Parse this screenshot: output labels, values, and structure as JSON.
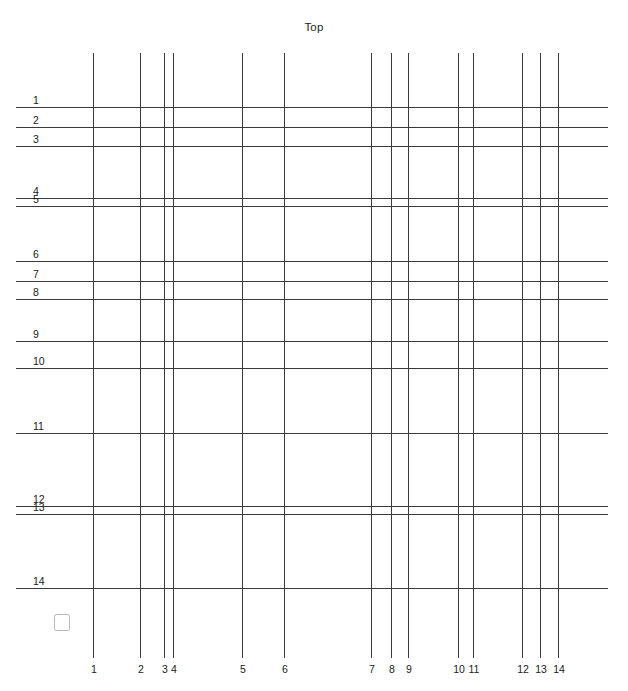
{
  "diagram": {
    "title": "Top",
    "background_color": "#ffffff",
    "line_color": "#3a3a3a",
    "label_color": "#1a1a1a",
    "marker_color": "#b7b7b7",
    "canvas": {
      "width": 628,
      "height": 691
    }
  },
  "vertical_lines": {
    "axis_label_position": "bottom",
    "span": {
      "y_start": 53,
      "y_end": 658
    },
    "items": [
      {
        "label": "1",
        "x": 93
      },
      {
        "label": "2",
        "x": 140
      },
      {
        "label": "3",
        "x": 164
      },
      {
        "label": "4",
        "x": 173
      },
      {
        "label": "5",
        "x": 242
      },
      {
        "label": "6",
        "x": 284
      },
      {
        "label": "7",
        "x": 371
      },
      {
        "label": "8",
        "x": 391
      },
      {
        "label": "9",
        "x": 408
      },
      {
        "label": "10",
        "x": 458
      },
      {
        "label": "11",
        "x": 473
      },
      {
        "label": "12",
        "x": 522
      },
      {
        "label": "13",
        "x": 540
      },
      {
        "label": "14",
        "x": 558
      }
    ]
  },
  "horizontal_lines": {
    "axis_label_position": "left",
    "span": {
      "x_start": 16,
      "x_end": 608
    },
    "items": [
      {
        "label": "1",
        "y": 107
      },
      {
        "label": "2",
        "y": 127
      },
      {
        "label": "3",
        "y": 146
      },
      {
        "label": "4",
        "y": 198
      },
      {
        "label": "5",
        "y": 206
      },
      {
        "label": "6",
        "y": 261
      },
      {
        "label": "7",
        "y": 281
      },
      {
        "label": "8",
        "y": 299
      },
      {
        "label": "9",
        "y": 341
      },
      {
        "label": "10",
        "y": 368
      },
      {
        "label": "11",
        "y": 433
      },
      {
        "label": "12",
        "y": 506
      },
      {
        "label": "13",
        "y": 514
      },
      {
        "label": "14",
        "y": 588
      }
    ]
  },
  "corner_marker": {
    "name": "origin-square",
    "x": 54,
    "y": 614,
    "size": 16
  }
}
